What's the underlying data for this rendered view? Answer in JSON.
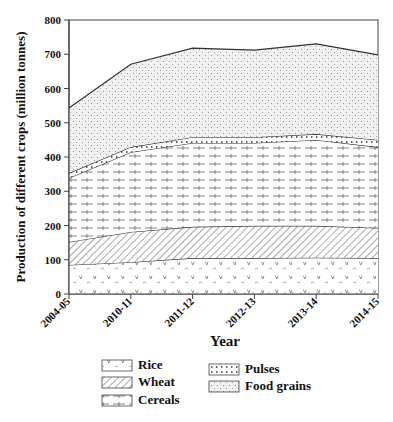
{
  "chart_data": {
    "type": "area",
    "stacked": true,
    "title": "",
    "xlabel": "Year",
    "ylabel": "Production of different crops (million tonnes)",
    "ylim": [
      0,
      800
    ],
    "yticks": [
      0,
      100,
      200,
      300,
      400,
      500,
      600,
      700,
      800
    ],
    "categories": [
      "2004-05",
      "2010-11",
      "2011-12",
      "2012-13",
      "2013-14",
      "2014-15"
    ],
    "grid": false,
    "legend_position": "bottom",
    "series": [
      {
        "name": "Rice",
        "pattern": "rice",
        "values": [
          85,
          93,
          105,
          105,
          106,
          105
        ],
        "stacked_top": [
          85,
          93,
          105,
          105,
          106,
          105
        ]
      },
      {
        "name": "Wheat",
        "pattern": "wheat",
        "values": [
          67,
          88,
          91,
          94,
          93,
          88
        ],
        "stacked_top": [
          152,
          181,
          196,
          199,
          199,
          193
        ]
      },
      {
        "name": "Cereals",
        "pattern": "cereals",
        "values": [
          187,
          233,
          245,
          242,
          251,
          236
        ],
        "stacked_top": [
          339,
          414,
          441,
          441,
          450,
          429
        ]
      },
      {
        "name": "Pulses",
        "pattern": "pulses",
        "values": [
          14,
          15,
          17,
          17,
          17,
          21
        ],
        "stacked_top": [
          353,
          429,
          458,
          458,
          467,
          450
        ]
      },
      {
        "name": "Food grains",
        "pattern": "food",
        "values": [
          190,
          242,
          260,
          254,
          263,
          248
        ],
        "stacked_top": [
          543,
          671,
          718,
          712,
          730,
          698
        ]
      }
    ],
    "legend": {
      "col1": [
        "Rice",
        "Wheat",
        "Cereals"
      ],
      "col2": [
        "Pulses",
        "Food grains"
      ]
    }
  },
  "colors": {
    "line": "#333333",
    "axis": "#444444",
    "fill_background": "#ffffff",
    "dot_pattern": "#9a9a9a"
  }
}
